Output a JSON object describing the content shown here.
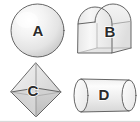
{
  "figure": {
    "background_color": "#ffffff",
    "outline_color": "#555555",
    "label_color": "#2a2a2a",
    "width": 140,
    "height": 122
  },
  "shapes": [
    {
      "id": "sphere",
      "label": "A",
      "name": "sphere",
      "position": "top-left",
      "label_x": 38,
      "label_y": 32,
      "fill_light": "#fdfdfd",
      "fill_mid": "#ededed",
      "fill_dark": "#d2d2d2"
    },
    {
      "id": "arch-prism",
      "label": "B",
      "name": "half-cylinder-arch-prism",
      "position": "top-right",
      "label_x": 110,
      "label_y": 33,
      "fill_light": "#fafafa",
      "fill_mid": "#eaeaea",
      "fill_dark": "#d8d8d8"
    },
    {
      "id": "octahedron",
      "label": "C",
      "name": "octahedron",
      "position": "bottom-left",
      "label_x": 33,
      "label_y": 92,
      "fill_light": "#f2f2f2",
      "fill_mid": "#dcdcdc",
      "fill_dark": "#c4c4c4"
    },
    {
      "id": "cylinder",
      "label": "D",
      "name": "cylinder",
      "position": "bottom-right",
      "label_x": 104,
      "label_y": 96,
      "fill_light": "#fbfbfb",
      "fill_mid": "#ebebeb",
      "fill_dark": "#d6d6d6"
    }
  ]
}
